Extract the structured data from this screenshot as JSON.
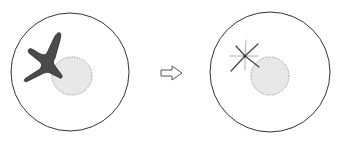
{
  "diagram": {
    "colors": {
      "outline": "#333333",
      "dark_body": "#4a4a4a",
      "nucleus_fill": "#e8e8e8",
      "nucleus_border": "#777777",
      "star_lines": "#444444",
      "star_lines_light": "#999999",
      "arrow": "#555555"
    },
    "panels": [
      {
        "label": "before",
        "shape": "dark-cross-body"
      },
      {
        "label": "after",
        "shape": "radiating-star"
      }
    ],
    "arrow": {
      "direction": "right",
      "style": "hollow"
    }
  }
}
